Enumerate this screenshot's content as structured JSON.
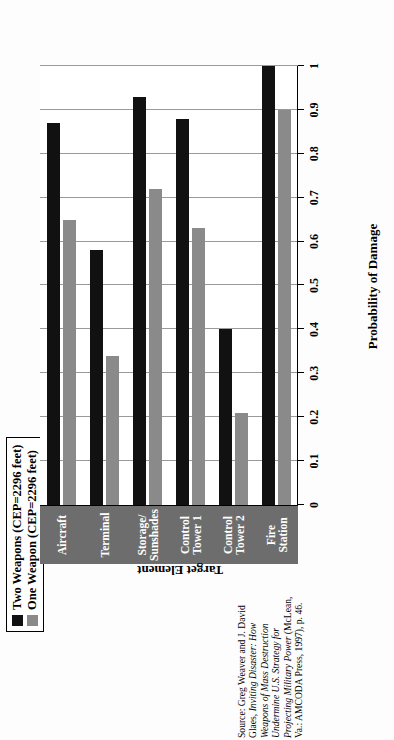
{
  "chart_data": {
    "type": "bar",
    "orientation": "vertical",
    "title": "",
    "xlabel": "Target Element",
    "ylabel": "Probability of Damage",
    "ylim": [
      0,
      1
    ],
    "grid": true,
    "legend_position": "top-left",
    "categories": [
      "Aircraft",
      "Terminal",
      "Storage/\nSunshades",
      "Control\nTower 1",
      "Control\nTower 2",
      "Fire\nStation"
    ],
    "tick_labels": [
      "0",
      "0.1",
      "0.2",
      "0.3",
      "0.4",
      "0.5",
      "0.6",
      "0.7",
      "0.8",
      "0.9",
      "1"
    ],
    "tick_values": [
      0,
      0.1,
      0.2,
      0.3,
      0.4,
      0.5,
      0.6,
      0.7,
      0.8,
      0.9,
      1
    ],
    "series": [
      {
        "name": "Two Weapons (CEP=2296 feet)",
        "color": "#111111",
        "values": [
          0.87,
          0.58,
          0.93,
          0.88,
          0.4,
          1.0
        ]
      },
      {
        "name": "One Weapon (CEP=2296 feet)",
        "color": "#8a8a8a",
        "values": [
          0.65,
          0.34,
          0.72,
          0.63,
          0.21,
          0.9
        ]
      }
    ]
  },
  "legend": {
    "items": [
      {
        "label": "Two Weapons (CEP=2296 feet)",
        "swatch": "#111111"
      },
      {
        "label": "One Weapon (CEP=2296 feet)",
        "swatch": "#8a8a8a"
      }
    ]
  },
  "source_note": {
    "prefix": "Source: Greg Weaver and J. David Glaes, ",
    "title_italic": "Inviting Disaster: How Weapons of Mass Destruction Undermine U.S. Strategy for Projecting Military Power",
    "suffix": " (McLean, Va.: AMCODA Press, 1997), p. 46."
  }
}
